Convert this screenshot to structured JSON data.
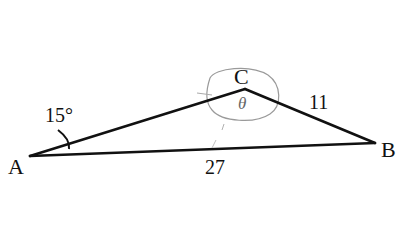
{
  "diagram": {
    "type": "triangle",
    "vertices": [
      {
        "name": "A",
        "label": "A"
      },
      {
        "name": "C",
        "label": "C"
      },
      {
        "name": "B",
        "label": "B"
      }
    ],
    "angle_A": {
      "label": "15°"
    },
    "angle_C": {
      "label": "θ"
    },
    "side_CB": {
      "label": "11"
    },
    "side_AB": {
      "label": "27"
    },
    "colors": {
      "stroke": "#111111",
      "pencil": "#8a8a8a",
      "background": "#ffffff"
    }
  }
}
